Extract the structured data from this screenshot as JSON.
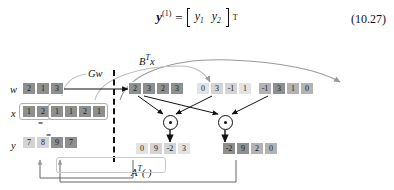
{
  "equation": {
    "lhs_base": "y",
    "lhs_sup": "(1)",
    "equals": "=",
    "entry1": "y",
    "entry1_sub": "1",
    "entry2": "y",
    "entry2_sub": "2",
    "transpose": "T",
    "number": "(10.27)"
  },
  "diagram": {
    "labels": {
      "w": "w",
      "x": "x",
      "y": "y",
      "gw": "Gw",
      "btx_B": "B",
      "btx_sup": "T",
      "btx_x": "x",
      "at_A": "A",
      "at_sup": "T",
      "at_arg": "(·)",
      "equal_x": "=",
      "equal_y": "="
    },
    "rows": {
      "w": {
        "label": "w",
        "cells": [
          {
            "v": "2",
            "shade": "c-dark"
          },
          {
            "v": "1",
            "shade": "c-dark"
          },
          {
            "v": "3",
            "shade": "c-dark"
          }
        ]
      },
      "x": {
        "label": "x",
        "cells": [
          {
            "v": "1",
            "shade": "c-dark"
          },
          {
            "v": "2",
            "shade": "c-dark"
          },
          {
            "v": "1",
            "shade": "c-dark"
          },
          {
            "v": "1",
            "shade": "c-dark"
          },
          {
            "v": "2",
            "shade": "c-dark"
          },
          {
            "v": "1",
            "shade": "c-dark"
          }
        ]
      },
      "y": {
        "label": "y",
        "cells": [
          {
            "v": "7",
            "shade": "c-light"
          },
          {
            "v": "8",
            "shade": "c-light"
          },
          {
            "v": "9",
            "shade": "c-dark"
          },
          {
            "v": "7",
            "shade": "c-dark"
          }
        ]
      },
      "gw_out": {
        "cells": [
          {
            "v": "2",
            "shade": "c-dark"
          },
          {
            "v": "3",
            "shade": "c-dark"
          },
          {
            "v": "2",
            "shade": "c-dark"
          },
          {
            "v": "3",
            "shade": "c-dark"
          }
        ]
      },
      "mid": {
        "cells": [
          {
            "v": "0",
            "shade": "c-pale"
          },
          {
            "v": "3",
            "shade": "c-light"
          },
          {
            "v": "-1",
            "shade": "c-light"
          },
          {
            "v": "1",
            "shade": "c-pale"
          }
        ]
      },
      "right": {
        "cells": [
          {
            "v": "-1",
            "shade": "c-mid"
          },
          {
            "v": "3",
            "shade": "c-dark"
          },
          {
            "v": "1",
            "shade": "c-mid"
          },
          {
            "v": "0",
            "shade": "c-mid"
          }
        ]
      },
      "prod_left": {
        "cells": [
          {
            "v": "0",
            "shade": "c-pale"
          },
          {
            "v": "9",
            "shade": "c-light"
          },
          {
            "v": "-2",
            "shade": "c-light"
          },
          {
            "v": "3",
            "shade": "c-pale"
          }
        ]
      },
      "prod_right": {
        "cells": [
          {
            "v": "-2",
            "shade": "c-dark"
          },
          {
            "v": "9",
            "shade": "c-dark"
          },
          {
            "v": "2",
            "shade": "c-mid"
          },
          {
            "v": "0",
            "shade": "c-mid"
          }
        ]
      }
    },
    "operators": [
      {
        "name": "hadamard-product-left",
        "glyph": "⊙"
      },
      {
        "name": "hadamard-product-right",
        "glyph": "⊙"
      }
    ],
    "colors": {
      "dark": "#8f8f8f",
      "mid": "#b3b3b3",
      "light": "#d4d4d4",
      "pale": "#e3e3e3",
      "arrow_gray": "#9a9a9a",
      "arrow_black": "#111111"
    }
  }
}
